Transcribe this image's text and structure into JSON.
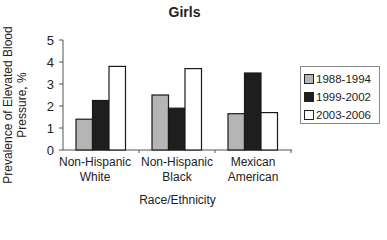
{
  "chart_data": {
    "type": "bar",
    "title": "Girls",
    "xlabel": "Race/Ethnicity",
    "ylabel": "Prevalence of Elevated Blood Pressure, %",
    "ylim": [
      0,
      5
    ],
    "yticks": [
      0,
      1,
      2,
      3,
      4,
      5
    ],
    "categories": [
      "Non-Hispanic White",
      "Non-Hispanic Black",
      "Mexican American"
    ],
    "category_lines": [
      [
        "Non-Hispanic",
        "White"
      ],
      [
        "Non-Hispanic",
        "Black"
      ],
      [
        "Mexican",
        "American"
      ]
    ],
    "series": [
      {
        "name": "1988-1994",
        "color": "#b5b5b5",
        "values": [
          1.4,
          2.5,
          1.65
        ]
      },
      {
        "name": "1999-2002",
        "color": "#1e1e1e",
        "values": [
          2.25,
          1.9,
          3.5
        ]
      },
      {
        "name": "2003-2006",
        "color": "#ffffff",
        "values": [
          3.8,
          3.7,
          1.7
        ]
      }
    ],
    "grid": false,
    "legend_position": "right"
  }
}
